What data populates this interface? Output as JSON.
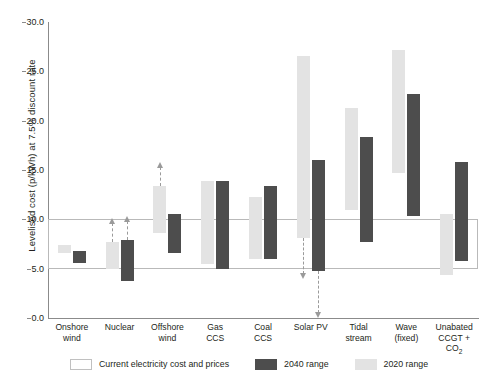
{
  "chart_data": {
    "type": "bar",
    "title": "",
    "subtitle": "",
    "xlabel": "",
    "ylabel": "Levelised cost (p/kWh) at 7.5% discount rate",
    "ylim": [
      0.0,
      30.0
    ],
    "yticks": [
      "0.0",
      "5.0",
      "10.0",
      "15.0",
      "20.0",
      "25.0",
      "30.0"
    ],
    "ytick_values": [
      0.0,
      5.0,
      10.0,
      15.0,
      20.0,
      25.0,
      30.0
    ],
    "grid": false,
    "legend_position": "bottom",
    "categories": [
      "Onshore\nwind",
      "Nuclear",
      "Offshore\nwind",
      "Gas\nCCS",
      "Coal\nCCS",
      "Solar PV",
      "Tidal\nstream",
      "Wave\n(fixed)",
      "Unabated\nCCGT + CO2"
    ],
    "series": [
      {
        "name": "2020 range",
        "color": "#e3e3e3",
        "ranges": [
          {
            "low": 6.6,
            "high": 7.4,
            "arrow": null
          },
          {
            "low": 5.0,
            "high": 7.7,
            "arrow": "up"
          },
          {
            "low": 8.6,
            "high": 13.4,
            "arrow": "up"
          },
          {
            "low": 5.5,
            "high": 13.9,
            "arrow": null
          },
          {
            "low": 6.0,
            "high": 12.3,
            "arrow": null
          },
          {
            "low": 8.1,
            "high": 26.6,
            "arrow": "down"
          },
          {
            "low": 10.9,
            "high": 21.3,
            "arrow": null
          },
          {
            "low": 14.7,
            "high": 27.2,
            "arrow": null
          },
          {
            "low": 4.4,
            "high": 10.5,
            "arrow": null
          }
        ]
      },
      {
        "name": "2040 range",
        "color": "#4d4d4d",
        "ranges": [
          {
            "low": 5.6,
            "high": 6.8,
            "arrow": null
          },
          {
            "low": 3.8,
            "high": 7.9,
            "arrow": "up"
          },
          {
            "low": 6.6,
            "high": 10.5,
            "arrow": null
          },
          {
            "low": 5.0,
            "high": 13.9,
            "arrow": null
          },
          {
            "low": 6.0,
            "high": 13.4,
            "arrow": null
          },
          {
            "low": 4.8,
            "high": 16.0,
            "arrow": "down"
          },
          {
            "low": 7.7,
            "high": 18.3,
            "arrow": null
          },
          {
            "low": 10.3,
            "high": 22.7,
            "arrow": null
          },
          {
            "low": 5.8,
            "high": 15.8,
            "arrow": null
          }
        ]
      }
    ],
    "reference_band": {
      "label": "Current electricity cost and prices",
      "low": 5.0,
      "high": 10.0,
      "color": "#b9b9b9"
    },
    "annotations": [
      {
        "category": "Nuclear",
        "series": "2020 range",
        "type": "arrow-up",
        "from": 7.7,
        "to": 10.3
      },
      {
        "category": "Nuclear",
        "series": "2040 range",
        "type": "arrow-up",
        "from": 7.9,
        "to": 10.3
      },
      {
        "category": "Offshore wind",
        "series": "2020 range",
        "type": "arrow-up",
        "from": 13.4,
        "to": 14.5
      },
      {
        "category": "Solar PV",
        "series": "2020 range",
        "type": "arrow-down",
        "from": 8.1,
        "to": 5.0
      },
      {
        "category": "Solar PV",
        "series": "2040 range",
        "type": "arrow-down",
        "from": 4.8,
        "to": 1.6
      }
    ]
  },
  "legend": {
    "items": [
      {
        "label": "Current electricity cost and prices",
        "swatch": "outline"
      },
      {
        "label": "2040 range",
        "swatch": "dark"
      },
      {
        "label": "2020 range",
        "swatch": "light"
      }
    ]
  },
  "colors": {
    "light_bar": "#e3e3e3",
    "dark_bar": "#4d4d4d",
    "axis": "#8b8b8b",
    "reference_box": "#b9b9b9",
    "arrow": "#9a9a9a",
    "text": "#231f20",
    "background": "#ffffff"
  }
}
